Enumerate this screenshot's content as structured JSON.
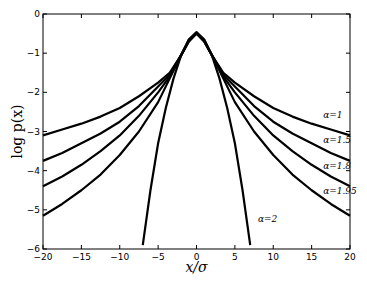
{
  "chart_data": {
    "type": "line",
    "title": "",
    "xlabel": "x/σ",
    "ylabel": "log p(x)",
    "xlim": [
      -20,
      20
    ],
    "ylim": [
      -6,
      0
    ],
    "xticks": [
      -20,
      -15,
      -10,
      -5,
      0,
      5,
      10,
      15,
      20
    ],
    "yticks": [
      0,
      -1,
      -2,
      -3,
      -4,
      -5,
      -6
    ],
    "grid": false,
    "x": [
      -20,
      -17.5,
      -15,
      -12.5,
      -10,
      -7.5,
      -5,
      -3.5,
      -2,
      -1,
      0,
      1,
      2,
      3.5,
      5,
      7.5,
      10,
      12.5,
      15,
      17.5,
      20
    ],
    "series": [
      {
        "name": "α=1",
        "values": [
          -3.1,
          -2.95,
          -2.8,
          -2.62,
          -2.4,
          -2.1,
          -1.75,
          -1.5,
          -1.05,
          -0.7,
          -0.5,
          -0.7,
          -1.05,
          -1.5,
          -1.75,
          -2.1,
          -2.4,
          -2.62,
          -2.8,
          -2.95,
          -3.1
        ]
      },
      {
        "name": "α=1.5",
        "values": [
          -3.75,
          -3.55,
          -3.3,
          -3.05,
          -2.75,
          -2.35,
          -1.85,
          -1.55,
          -1.05,
          -0.7,
          -0.5,
          -0.7,
          -1.05,
          -1.55,
          -1.85,
          -2.35,
          -2.75,
          -3.05,
          -3.3,
          -3.55,
          -3.75
        ]
      },
      {
        "name": "α=1.8",
        "values": [
          -4.4,
          -4.15,
          -3.85,
          -3.5,
          -3.1,
          -2.6,
          -2.0,
          -1.6,
          -1.05,
          -0.68,
          -0.48,
          -0.68,
          -1.05,
          -1.6,
          -2.0,
          -2.6,
          -3.1,
          -3.5,
          -3.85,
          -4.15,
          -4.4
        ]
      },
      {
        "name": "α=1.95",
        "values": [
          -5.15,
          -4.85,
          -4.5,
          -4.1,
          -3.6,
          -3.0,
          -2.25,
          -1.65,
          -1.05,
          -0.66,
          -0.47,
          -0.66,
          -1.05,
          -1.65,
          -2.25,
          -3.0,
          -3.6,
          -4.1,
          -4.5,
          -4.85,
          -5.15
        ]
      },
      {
        "name": "α=2",
        "x": [
          -7,
          -6,
          -5,
          -4,
          -3,
          -2,
          -1,
          0,
          1,
          2,
          3,
          4,
          5,
          6,
          7
        ],
        "values": [
          -5.9,
          -4.5,
          -3.3,
          -2.4,
          -1.65,
          -1.05,
          -0.65,
          -0.47,
          -0.65,
          -1.05,
          -1.65,
          -2.4,
          -3.3,
          -4.5,
          -5.9
        ]
      }
    ],
    "annotations": [
      {
        "text": "α=1",
        "x": 16.5,
        "y": -2.65
      },
      {
        "text": "α=1.5",
        "x": 16.5,
        "y": -3.3
      },
      {
        "text": "α=1.8",
        "x": 16.5,
        "y": -3.95
      },
      {
        "text": "α=1.95",
        "x": 16.5,
        "y": -4.6
      },
      {
        "text": "α=2",
        "x": 8,
        "y": -5.3
      }
    ]
  }
}
